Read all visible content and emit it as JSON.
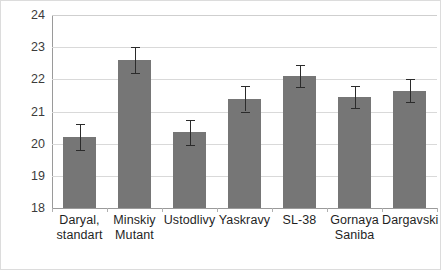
{
  "chart_data": {
    "type": "bar",
    "title": "",
    "subtitle": "",
    "xlabel": "",
    "ylabel": "",
    "ylim": [
      18,
      24
    ],
    "yticks": [
      18,
      19,
      20,
      21,
      22,
      23,
      24
    ],
    "ytick_labels": [
      "18",
      "19",
      "20",
      "21",
      "22",
      "23",
      "24"
    ],
    "grid": true,
    "legend": "none",
    "bar_color": "#767676",
    "error_bar_color": "#2b2b2b",
    "gridline_color": "#d9d9d9",
    "axis_color": "#9a9a9a",
    "categories": [
      "Daryal, standart",
      "Minskiy Mutant",
      "Ustodlivy",
      "Yaskravy",
      "SL-38",
      "Gornaya Saniba",
      "Dargavski"
    ],
    "category_lines": [
      [
        "Daryal,",
        "standart"
      ],
      [
        "Minskiy",
        "Mutant"
      ],
      [
        "Ustodlivy",
        ""
      ],
      [
        "Yaskravy",
        ""
      ],
      [
        "SL-38",
        ""
      ],
      [
        "Gornaya",
        "Saniba"
      ],
      [
        "Dargavski",
        ""
      ]
    ],
    "values": [
      20.2,
      22.6,
      20.35,
      21.4,
      22.1,
      21.45,
      21.65
    ],
    "errors": [
      0.4,
      0.4,
      0.4,
      0.4,
      0.35,
      0.35,
      0.35
    ]
  }
}
